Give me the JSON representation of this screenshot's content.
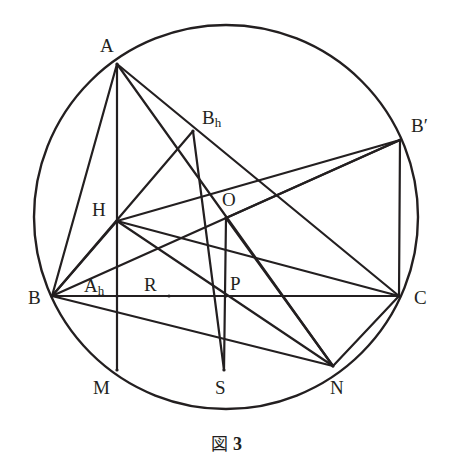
{
  "figure": {
    "caption_label": "図",
    "caption_number": "3",
    "stroke_color": "#231f20",
    "background_color": "#ffffff",
    "line_width": 2.2,
    "circle_line_width": 2.4
  },
  "circle": {
    "center_x": 226,
    "center_y": 217,
    "radius": 192,
    "label": "circumcircle"
  },
  "points": [
    {
      "id": "A",
      "label": "A",
      "sub": "",
      "prime": false,
      "x": 117,
      "y": 64,
      "label_x": 100,
      "label_y": 36,
      "on_circle": true
    },
    {
      "id": "B",
      "label": "B",
      "sub": "",
      "prime": false,
      "x": 52,
      "y": 296,
      "label_x": 28,
      "label_y": 288,
      "on_circle": true
    },
    {
      "id": "C",
      "label": "C",
      "sub": "",
      "prime": false,
      "x": 399,
      "y": 296,
      "label_x": 414,
      "label_y": 288,
      "on_circle": true
    },
    {
      "id": "Bp",
      "label": "B",
      "sub": "",
      "prime": true,
      "x": 400,
      "y": 140,
      "label_x": 411,
      "label_y": 116,
      "on_circle": true
    },
    {
      "id": "O",
      "label": "O",
      "sub": "",
      "prime": false,
      "x": 226,
      "y": 218,
      "label_x": 222,
      "label_y": 190,
      "on_circle": false
    },
    {
      "id": "H",
      "label": "H",
      "sub": "",
      "prime": false,
      "x": 117,
      "y": 221,
      "label_x": 92,
      "label_y": 200,
      "on_circle": false
    },
    {
      "id": "Bh",
      "label": "B",
      "sub": "h",
      "prime": false,
      "x": 193,
      "y": 131,
      "label_x": 202,
      "label_y": 108,
      "on_circle": false
    },
    {
      "id": "Ah",
      "label": "A",
      "sub": "h",
      "prime": false,
      "x": 117,
      "y": 296,
      "label_x": 84,
      "label_y": 276,
      "on_circle": false
    },
    {
      "id": "R",
      "label": "R",
      "sub": "",
      "prime": false,
      "x": 169,
      "y": 296,
      "label_x": 144,
      "label_y": 275,
      "on_circle": false
    },
    {
      "id": "P",
      "label": "P",
      "sub": "",
      "prime": false,
      "x": 226,
      "y": 296,
      "label_x": 230,
      "label_y": 274,
      "on_circle": false
    },
    {
      "id": "M",
      "label": "M",
      "sub": "",
      "prime": false,
      "x": 117,
      "y": 370,
      "label_x": 93,
      "label_y": 378,
      "on_circle": true
    },
    {
      "id": "S",
      "label": "S",
      "sub": "",
      "prime": false,
      "x": 224,
      "y": 370,
      "label_x": 215,
      "label_y": 378,
      "on_circle": true
    },
    {
      "id": "N",
      "label": "N",
      "sub": "",
      "prime": false,
      "x": 333,
      "y": 366,
      "label_x": 330,
      "label_y": 378,
      "on_circle": true
    }
  ],
  "segments": [
    {
      "from": "A",
      "to": "B",
      "name": "segment-A-B"
    },
    {
      "from": "A",
      "to": "M",
      "name": "segment-A-M-altitude"
    },
    {
      "from": "A",
      "to": "N",
      "name": "segment-A-N"
    },
    {
      "from": "A",
      "to": "C",
      "name": "segment-A-C"
    },
    {
      "from": "B",
      "to": "C",
      "name": "segment-B-C"
    },
    {
      "from": "B",
      "to": "Bh",
      "name": "segment-B-Bh-altitude"
    },
    {
      "from": "B",
      "to": "H",
      "name": "segment-B-H"
    },
    {
      "from": "B",
      "to": "N",
      "name": "segment-B-N"
    },
    {
      "from": "B",
      "to": "Bp",
      "name": "segment-B-Bprime"
    },
    {
      "from": "Bh",
      "to": "S",
      "name": "segment-Bh-S"
    },
    {
      "from": "H",
      "to": "C",
      "name": "segment-H-C"
    },
    {
      "from": "H",
      "to": "N",
      "name": "segment-H-N"
    },
    {
      "from": "H",
      "to": "Bp",
      "name": "segment-H-Bprime"
    },
    {
      "from": "O",
      "to": "S",
      "name": "segment-O-S"
    },
    {
      "from": "O",
      "to": "N",
      "name": "segment-O-N"
    },
    {
      "from": "O",
      "to": "Bp",
      "name": "segment-O-Bprime"
    },
    {
      "from": "Bp",
      "to": "C",
      "name": "segment-Bprime-C"
    },
    {
      "from": "C",
      "to": "N",
      "name": "segment-C-N"
    },
    {
      "from": "C",
      "to": "R",
      "name": "segment-C-R"
    }
  ]
}
